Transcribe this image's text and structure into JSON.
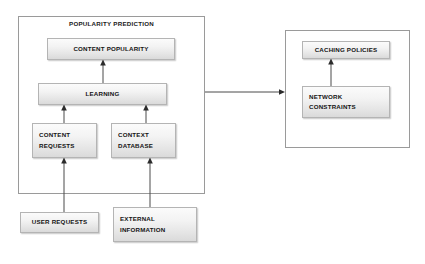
{
  "diagram": {
    "containers": [
      {
        "id": "popularity-prediction",
        "label": "POPULARITY PREDICTION"
      },
      {
        "id": "network-side",
        "label": ""
      }
    ],
    "nodes": [
      {
        "id": "content-popularity",
        "lines": [
          "CONTENT POPULARITY"
        ]
      },
      {
        "id": "learning",
        "lines": [
          "LEARNING"
        ]
      },
      {
        "id": "content-requests",
        "lines": [
          "CONTENT",
          "REQUESTS"
        ]
      },
      {
        "id": "context-database",
        "lines": [
          "CONTEXT",
          "DATABASE"
        ]
      },
      {
        "id": "user-requests",
        "lines": [
          "USER REQUESTS"
        ]
      },
      {
        "id": "external-information",
        "lines": [
          "EXTERNAL",
          "INFORMATION"
        ]
      },
      {
        "id": "caching-policies",
        "lines": [
          "CACHING POLICIES"
        ]
      },
      {
        "id": "network-constraints",
        "lines": [
          "NETWORK",
          "CONSTRAINTS"
        ]
      }
    ],
    "edges": [
      {
        "id": "edge-learning-to-content-popularity",
        "from": "learning",
        "to": "content-popularity",
        "direction": "up"
      },
      {
        "id": "edge-content-requests-to-learning",
        "from": "content-requests",
        "to": "learning",
        "direction": "up"
      },
      {
        "id": "edge-context-database-to-learning",
        "from": "context-database",
        "to": "learning",
        "direction": "up"
      },
      {
        "id": "edge-user-requests-to-content-requests",
        "from": "user-requests",
        "to": "content-requests",
        "direction": "up"
      },
      {
        "id": "edge-external-information-to-context-database",
        "from": "external-information",
        "to": "context-database",
        "direction": "up"
      },
      {
        "id": "edge-popularity-prediction-to-network-side",
        "from": "popularity-prediction",
        "to": "network-side",
        "direction": "right"
      },
      {
        "id": "edge-network-constraints-to-caching-policies",
        "from": "network-constraints",
        "to": "caching-policies",
        "direction": "up"
      }
    ],
    "colors": {
      "background": "#ffffff",
      "node_fill_top": "#fbfbfb",
      "node_fill_bottom": "#dadada",
      "node_border": "#b4b4b4",
      "frame_border": "#9a9a9a",
      "connector": "#4a4a4a",
      "text": "#141414"
    }
  }
}
